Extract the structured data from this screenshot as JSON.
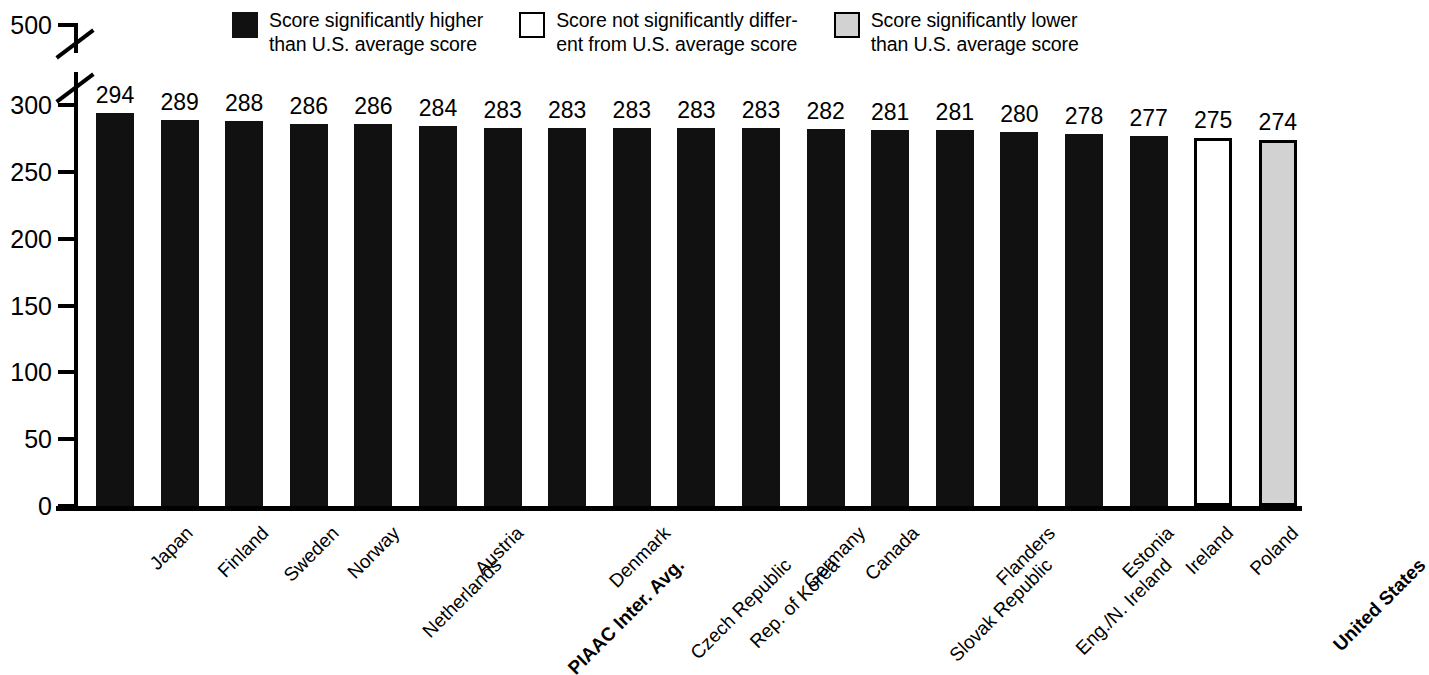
{
  "legend": {
    "items": [
      {
        "id": "higher",
        "swatch": "filled-black",
        "color": "#111111",
        "text": "Score significantly higher\nthan U.S. average score"
      },
      {
        "id": "same",
        "swatch": "filled-white",
        "color": "#ffffff",
        "text": "Score not significantly differ-\nent from U.S. average score"
      },
      {
        "id": "lower",
        "swatch": "filled-gray",
        "color": "#d2d2d2",
        "text": "Score significantly lower\nthan U.S. average score"
      }
    ]
  },
  "yaxis": {
    "ticks": [
      "500",
      "300",
      "250",
      "200",
      "150",
      "100",
      "50",
      "0"
    ],
    "break_after": "500",
    "min": 0,
    "max": 300
  },
  "chart_data": {
    "type": "bar",
    "title": "",
    "xlabel": "",
    "ylabel": "",
    "ylim": [
      0,
      300
    ],
    "yticks": [
      0,
      50,
      100,
      150,
      200,
      250,
      300
    ],
    "axis_break": {
      "above": 300,
      "to": 500
    },
    "grid": false,
    "legend_position": "top",
    "categories": [
      "Japan",
      "Finland",
      "Sweden",
      "Norway",
      "Netherlands",
      "Austria",
      "PIAAC Inter. Avg.",
      "Denmark",
      "Czech Republic",
      "Rep. of Korea",
      "Germany",
      "Canada",
      "Slovak Republic",
      "Flanders",
      "Eng./N. Ireland",
      "Estonia",
      "Ireland",
      "Poland",
      "United States"
    ],
    "values": [
      294,
      289,
      288,
      286,
      286,
      284,
      283,
      283,
      283,
      283,
      283,
      282,
      281,
      281,
      280,
      278,
      277,
      275,
      274
    ],
    "categories_bold": [
      "PIAAC Inter. Avg.",
      "United States"
    ],
    "point_styles": [
      "higher",
      "higher",
      "higher",
      "higher",
      "higher",
      "higher",
      "higher",
      "higher",
      "higher",
      "higher",
      "higher",
      "higher",
      "higher",
      "higher",
      "higher",
      "higher",
      "higher",
      "same",
      "lower"
    ],
    "style_colors": {
      "higher": "#111111",
      "same": "#ffffff",
      "lower": "#d2d2d2"
    }
  }
}
